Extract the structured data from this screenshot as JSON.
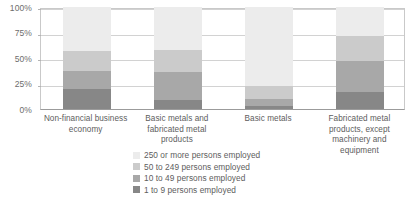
{
  "chart_data": {
    "type": "bar",
    "subtype": "stacked-percentage-column",
    "title": "",
    "xlabel": "",
    "ylabel": "",
    "ylim": [
      0,
      100
    ],
    "yticks": [
      0,
      25,
      50,
      75,
      100
    ],
    "ytick_labels": [
      "0%",
      "25%",
      "50%",
      "75%",
      "100%"
    ],
    "grid": true,
    "legend_position": "bottom",
    "categories": [
      "Non-financial business economy",
      "Basic metals and fabricated metal products",
      "Basic metals",
      "Fabricated metal products, except machinery and equipment"
    ],
    "series": [
      {
        "name": "1 to 9 persons employed",
        "color": "#878787",
        "values": [
          20.0,
          9.0,
          3.0,
          17.0
        ]
      },
      {
        "name": "10 to 49 persons employed",
        "color": "#a8a8a8",
        "values": [
          17.0,
          27.0,
          7.0,
          30.0
        ]
      },
      {
        "name": "50 to 249 persons employed",
        "color": "#cbcbcb",
        "values": [
          20.0,
          22.0,
          13.0,
          25.0
        ]
      },
      {
        "name": "250 or more persons employed",
        "color": "#ececec",
        "values": [
          43.0,
          42.0,
          77.0,
          28.0
        ]
      }
    ],
    "legend_order_displayed": [
      "250 or more persons employed",
      "50 to 249 persons employed",
      "10 to 49 persons employed",
      "1 to 9 persons employed"
    ]
  },
  "axis": {
    "ticks": [
      {
        "label": "100%",
        "value": 100
      },
      {
        "label": "75%",
        "value": 75
      },
      {
        "label": "50%",
        "value": 50
      },
      {
        "label": "25%",
        "value": 25
      },
      {
        "label": "0%",
        "value": 0
      }
    ]
  },
  "categories": [
    {
      "label": "Non-financial business economy"
    },
    {
      "label": "Basic metals and fabricated metal products"
    },
    {
      "label": "Basic metals"
    },
    {
      "label": "Fabricated metal products, except machinery and equipment"
    }
  ],
  "legend": [
    {
      "label": "250 or more persons employed",
      "color": "#ececec"
    },
    {
      "label": "50 to 249 persons employed",
      "color": "#cbcbcb"
    },
    {
      "label": "10 to 49 persons employed",
      "color": "#a8a8a8"
    },
    {
      "label": "1 to 9 persons employed",
      "color": "#878787"
    }
  ],
  "colors": {
    "gridline": "#d2d2d2",
    "axis": "#9b9b9b",
    "frame": "#c9c9c9",
    "text": "#5d5d5d",
    "background": "#ffffff"
  }
}
